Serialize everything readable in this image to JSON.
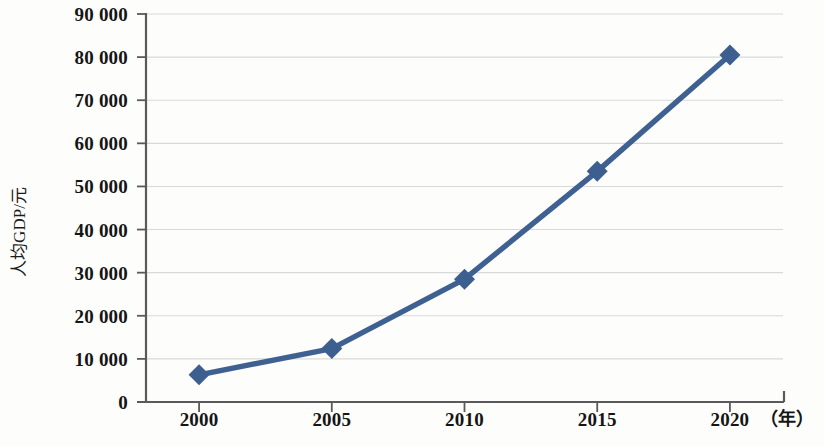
{
  "chart_data": {
    "type": "line",
    "title": "",
    "subtitle": "",
    "xlabel": "（年）",
    "ylabel": "人均GDP/元",
    "x": [
      2000,
      2005,
      2010,
      2015,
      2020
    ],
    "categories": [
      "2000",
      "2005",
      "2010",
      "2015",
      "2020"
    ],
    "values": [
      6300,
      12400,
      28500,
      53500,
      80500
    ],
    "series": [
      {
        "name": "人均GDP/元",
        "values": [
          6300,
          12400,
          28500,
          53500,
          80500
        ]
      }
    ],
    "xlim": [
      1998,
      2022
    ],
    "ylim": [
      0,
      90000
    ],
    "ytick_values": [
      0,
      10000,
      20000,
      30000,
      40000,
      50000,
      60000,
      70000,
      80000,
      90000
    ],
    "ytick_labels": [
      "0",
      "10 000",
      "20 000",
      "30 000",
      "40 000",
      "50 000",
      "60 000",
      "70 000",
      "80 000",
      "90 000"
    ],
    "xtick_labels": [
      "2000",
      "2005",
      "2010",
      "2015",
      "2020"
    ],
    "grid": "horizontal",
    "legend": "none",
    "marker": "diamond",
    "line_color": "#3f6192",
    "marker_color": "#3d5f8f",
    "grid_color": "#d9d9d9",
    "axis_color": "#5a5a5a",
    "background_color": "#fdfdfb",
    "annotations": []
  }
}
